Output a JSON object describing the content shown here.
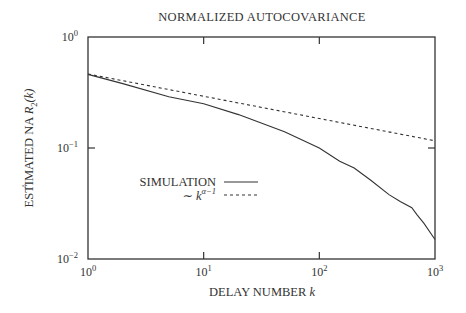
{
  "chart_data": {
    "type": "line",
    "title": "NORMALIZED AUTOCOVARIANCE",
    "xlabel": "DELAY NUMBER k",
    "ylabel": "ESTIMATED NA R̂2(k)",
    "xscale": "log",
    "yscale": "log",
    "xlim": [
      1,
      1000
    ],
    "ylim": [
      0.01,
      1
    ],
    "x_ticks": [
      {
        "base": "10",
        "exp": "0",
        "value": 1
      },
      {
        "base": "10",
        "exp": "1",
        "value": 10
      },
      {
        "base": "10",
        "exp": "2",
        "value": 100
      },
      {
        "base": "10",
        "exp": "3",
        "value": 1000
      }
    ],
    "y_ticks": [
      {
        "base": "10",
        "exp": "0",
        "value": 1
      },
      {
        "base": "10",
        "exp": "−1",
        "value": 0.1
      },
      {
        "base": "10",
        "exp": "−2",
        "value": 0.01
      }
    ],
    "grid": false,
    "legend_position": "center-left inside plot",
    "series": [
      {
        "name": "SIMULATION",
        "style": "solid",
        "x": [
          1,
          2,
          5,
          10,
          20,
          50,
          100,
          150,
          200,
          280,
          400,
          500,
          630,
          700,
          800,
          1000
        ],
        "y": [
          0.46,
          0.38,
          0.29,
          0.25,
          0.2,
          0.14,
          0.1,
          0.076,
          0.066,
          0.051,
          0.038,
          0.033,
          0.029,
          0.025,
          0.021,
          0.015
        ]
      },
      {
        "name": "~ k^(α−1)",
        "style": "dashed",
        "x": [
          1,
          1000
        ],
        "y": [
          0.464,
          0.116
        ]
      }
    ]
  },
  "labels": {
    "title": "NORMALIZED AUTOCOVARIANCE",
    "xlabel_text": "DELAY NUMBER ",
    "xlabel_var": "k",
    "ylabel_prefix": "ESTIMATED NA ",
    "ylabel_R": "R",
    "ylabel_hat": "^",
    "ylabel_sub": "2",
    "ylabel_arg": "(k)",
    "legend_sim": "SIMULATION",
    "legend_fit_tilde": "∼ ",
    "legend_fit_k": "k",
    "legend_fit_exp": "α−1"
  }
}
